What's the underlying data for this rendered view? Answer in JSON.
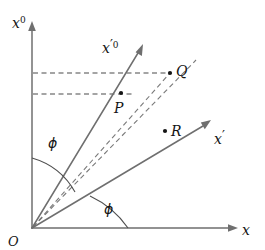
{
  "figure": {
    "background_color": "#ffffff",
    "axis_color": "#6f6f6f",
    "dashed_color": "#4a4a4a",
    "label_color": "#141414",
    "width": 265,
    "height": 250
  },
  "axes": [
    {
      "id": "x0",
      "label_base": "x",
      "label_sup": "0",
      "label_prime": "",
      "description": "vertical time axis",
      "start": [
        32,
        228
      ],
      "end": [
        32,
        24
      ],
      "label_pos": [
        12,
        22
      ]
    },
    {
      "id": "x",
      "label_base": "x",
      "label_sup": "",
      "label_prime": "",
      "description": "horizontal space axis",
      "start": [
        32,
        228
      ],
      "end": [
        237,
        228
      ],
      "label_pos": [
        243,
        234
      ]
    },
    {
      "id": "x0-prime",
      "label_base": "x",
      "label_sup": "0",
      "label_prime": "′",
      "description": "rotated time axis",
      "start": [
        32,
        228
      ],
      "end": [
        143,
        45
      ],
      "label_pos": [
        104,
        48
      ]
    },
    {
      "id": "x-prime",
      "label_base": "x",
      "label_sup": "",
      "label_prime": "′",
      "description": "rotated space axis",
      "start": [
        32,
        228
      ],
      "end": [
        211,
        121
      ],
      "label_pos": [
        215,
        139
      ]
    }
  ],
  "points": [
    {
      "id": "P",
      "label": "P",
      "dot": [
        121,
        93
      ],
      "label_pos": [
        114,
        112
      ]
    },
    {
      "id": "Q",
      "label": "Q",
      "dot": [
        170,
        73
      ],
      "label_pos": [
        177,
        70
      ]
    },
    {
      "id": "R",
      "label": "R",
      "dot": [
        165,
        131
      ],
      "label_pos": [
        171,
        131
      ]
    },
    {
      "id": "O",
      "label": "O",
      "dot": null,
      "label_pos": [
        10,
        243
      ]
    }
  ],
  "angles": [
    {
      "id": "phi-upper",
      "label": "ϕ",
      "label_pos": [
        52,
        143
      ],
      "description": "angle between vertical axis and rotated time axis",
      "arc": "M 32 158 A 70 70 0 0 1 74 191"
    },
    {
      "id": "phi-lower",
      "label": "ϕ",
      "label_pos": [
        107,
        209
      ],
      "description": "angle between horizontal axis and rotated space axis",
      "arc": "M 127 228 A 95 95 0 0 0 89 196"
    }
  ],
  "dashed_lines": [
    {
      "id": "q-horizontal",
      "description": "horizontal dashed line from vertical axis to point Q",
      "from": [
        33,
        73
      ],
      "to": [
        168,
        73
      ]
    },
    {
      "id": "p-horizontal",
      "description": "horizontal dashed line from vertical axis to P level",
      "from": [
        33,
        94
      ],
      "to": [
        133,
        94
      ]
    },
    {
      "id": "origin-to-q",
      "description": "dashed ray from origin through P to Q",
      "from": [
        33,
        227
      ],
      "to": [
        170,
        73
      ]
    },
    {
      "id": "origin-upper-right",
      "description": "dashed ray from origin past Q to upper right",
      "from": [
        33,
        227
      ],
      "to": [
        196,
        60
      ]
    }
  ]
}
